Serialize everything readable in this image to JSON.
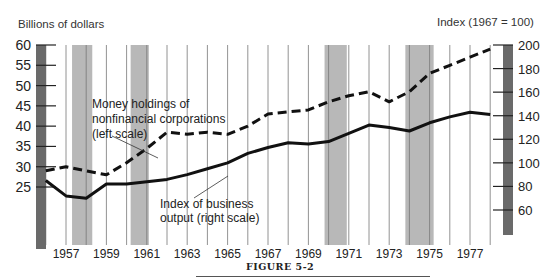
{
  "figure": {
    "label": "FIGURE 5-2"
  },
  "chart_data": {
    "type": "line",
    "title": "",
    "left_axis_label": "Billions of dollars",
    "right_axis_label": "Index (1967 = 100)",
    "xlabel": "",
    "left_ylim": [
      25,
      60
    ],
    "right_ylim": [
      60,
      200
    ],
    "left_ticks": [
      25,
      30,
      35,
      40,
      45,
      50,
      55,
      60
    ],
    "right_ticks": [
      60,
      80,
      100,
      120,
      140,
      160,
      180,
      200
    ],
    "x_tick_labels": [
      "1957",
      "1959",
      "1961",
      "1963",
      "1965",
      "1967",
      "1969",
      "1971",
      "1973",
      "1975",
      "1977"
    ],
    "x": [
      1956,
      1957,
      1958,
      1959,
      1960,
      1961,
      1962,
      1963,
      1964,
      1965,
      1966,
      1967,
      1968,
      1969,
      1970,
      1971,
      1972,
      1973,
      1974,
      1975,
      1976,
      1977,
      1978
    ],
    "grid": "vertical lines at each year",
    "shaded_recessions": [
      [
        1957.3,
        1958.3
      ],
      [
        1960.2,
        1961.1
      ],
      [
        1969.8,
        1970.9
      ],
      [
        1973.8,
        1975.2
      ]
    ],
    "series": [
      {
        "name": "Money holdings of nonfinancial corporations (left scale)",
        "axis": "left",
        "style": "dashed",
        "values": [
          29,
          30,
          29,
          28,
          31,
          34.5,
          38.5,
          38,
          38.5,
          38,
          40,
          43,
          43.5,
          44,
          46,
          47.5,
          48.5,
          46,
          48.5,
          53,
          55,
          57,
          59
        ]
      },
      {
        "name": "Index of business output (right scale)",
        "axis": "right",
        "style": "solid",
        "values": [
          85,
          72,
          70,
          82,
          82,
          84,
          86,
          90,
          95,
          100,
          108,
          113,
          117,
          116,
          118,
          125,
          132,
          130,
          127,
          134,
          139,
          143,
          141
        ]
      }
    ],
    "annotations": [
      {
        "text_lines": [
          "Money holdings of",
          "nonfinancial corporations",
          "(left scale)"
        ],
        "points_to": "dashed series"
      },
      {
        "text_lines": [
          "Index of business",
          "output (right scale)"
        ],
        "points_to": "solid series"
      }
    ]
  }
}
